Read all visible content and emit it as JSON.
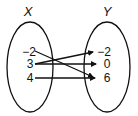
{
  "diagram": {
    "type": "mapping-diagram",
    "domain_label": "X",
    "range_label": "Y",
    "domain": [
      "−2",
      "3",
      "4"
    ],
    "range": [
      "−2",
      "0",
      "6"
    ],
    "mappings": [
      {
        "from": "-2",
        "to": "6"
      },
      {
        "from": "3",
        "to": "-2"
      },
      {
        "from": "3",
        "to": "0"
      },
      {
        "from": "4",
        "to": "6"
      }
    ],
    "stroke_color": "#111111"
  }
}
